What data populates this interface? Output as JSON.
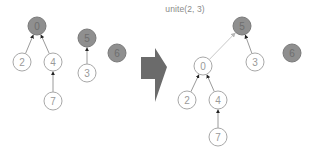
{
  "operation": {
    "label": "unite(2, 3)"
  },
  "colors": {
    "root_fill": "#8f8f8f",
    "root_stroke": "#7a7a7a",
    "node_fill": "#ffffff",
    "node_stroke": "#a8a8a8",
    "edge": "#9a9a9a",
    "new_edge": "#c8c8c8",
    "arrow": "#6b6b6b"
  },
  "before": {
    "nodes": [
      {
        "id": "0",
        "x": 37,
        "y": 26,
        "root": true
      },
      {
        "id": "2",
        "x": 22,
        "y": 62,
        "root": false
      },
      {
        "id": "4",
        "x": 53,
        "y": 62,
        "root": false
      },
      {
        "id": "7",
        "x": 53,
        "y": 101,
        "root": false
      },
      {
        "id": "5",
        "x": 87,
        "y": 38,
        "root": true
      },
      {
        "id": "3",
        "x": 87,
        "y": 73,
        "root": false
      },
      {
        "id": "6",
        "x": 117,
        "y": 53,
        "root": true
      }
    ],
    "edges": [
      {
        "from": "2",
        "to": "0",
        "new": false
      },
      {
        "from": "4",
        "to": "0",
        "new": false
      },
      {
        "from": "7",
        "to": "4",
        "new": false
      },
      {
        "from": "3",
        "to": "5",
        "new": false
      }
    ]
  },
  "after": {
    "nodes": [
      {
        "id": "5",
        "x": 242,
        "y": 26,
        "root": true
      },
      {
        "id": "0",
        "x": 203,
        "y": 66,
        "root": false
      },
      {
        "id": "3",
        "x": 255,
        "y": 62,
        "root": false
      },
      {
        "id": "2",
        "x": 187,
        "y": 100,
        "root": false
      },
      {
        "id": "4",
        "x": 218,
        "y": 100,
        "root": false
      },
      {
        "id": "7",
        "x": 218,
        "y": 137,
        "root": false
      },
      {
        "id": "6",
        "x": 292,
        "y": 53,
        "root": true
      }
    ],
    "edges": [
      {
        "from": "0",
        "to": "5",
        "new": true
      },
      {
        "from": "3",
        "to": "5",
        "new": false
      },
      {
        "from": "2",
        "to": "0",
        "new": false
      },
      {
        "from": "4",
        "to": "0",
        "new": false
      },
      {
        "from": "7",
        "to": "4",
        "new": false
      }
    ]
  },
  "transition_arrow": {
    "direction": "right"
  }
}
